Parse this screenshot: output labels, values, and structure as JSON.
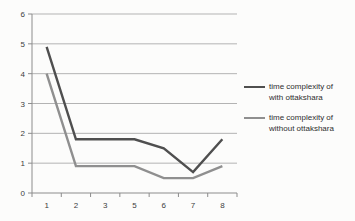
{
  "chart_data": {
    "type": "line",
    "categories": [
      "1",
      "2",
      "3",
      "5",
      "6",
      "7",
      "8"
    ],
    "series": [
      {
        "name": "time complexity of with ottakshara",
        "values": [
          4.9,
          1.8,
          1.8,
          1.8,
          1.5,
          0.7,
          1.8
        ],
        "color": "#4f4f4f"
      },
      {
        "name": "time complexity of without ottakshara",
        "values": [
          4.0,
          0.9,
          0.9,
          0.9,
          0.5,
          0.5,
          0.9
        ],
        "color": "#8f8f8f"
      }
    ],
    "title": "",
    "xlabel": "",
    "ylabel": "",
    "ylim": [
      0,
      6
    ],
    "y_ticks": [
      0,
      1,
      2,
      3,
      4,
      5,
      6
    ],
    "grid": true,
    "legend_position": "right"
  },
  "colors": {
    "background": "#fcfcfb",
    "gridline": "#b3b3b3",
    "axis": "#8c8c8c",
    "tick_text": "#3d3d3d",
    "legend_text": "#2e2e2e"
  }
}
